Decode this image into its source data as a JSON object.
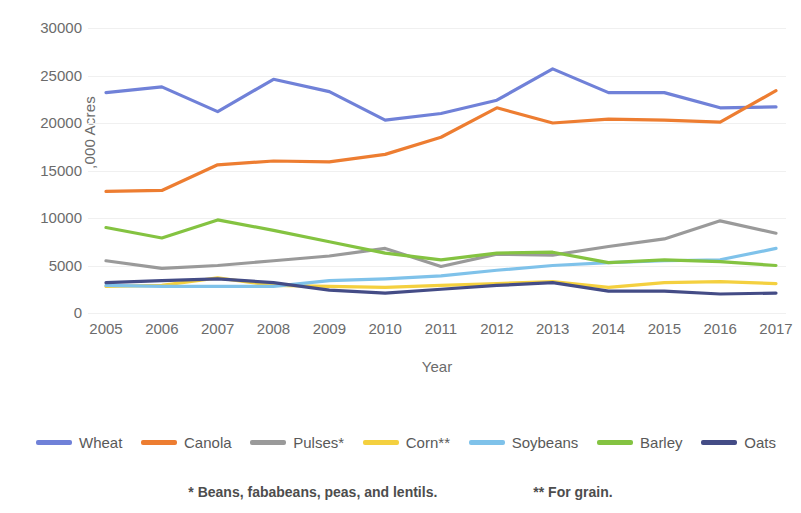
{
  "chart_data": {
    "type": "line",
    "title": "",
    "xlabel": "Year",
    "ylabel": ",000 Acres",
    "categories": [
      "2005",
      "2006",
      "2007",
      "2008",
      "2009",
      "2010",
      "2011",
      "2012",
      "2013",
      "2014",
      "2015",
      "2016",
      "2017"
    ],
    "x": [
      2005,
      2006,
      2007,
      2008,
      2009,
      2010,
      2011,
      2012,
      2013,
      2014,
      2015,
      2016,
      2017
    ],
    "ylim": [
      0,
      30000
    ],
    "yticks": [
      0,
      5000,
      10000,
      15000,
      20000,
      25000,
      30000
    ],
    "ytick_labels": [
      "0",
      "5000",
      "10000",
      "15000",
      "20000",
      "25000",
      "30000"
    ],
    "grid": true,
    "legend_position": "bottom",
    "series": [
      {
        "name": "Wheat",
        "color": "#7081D8",
        "values": [
          23200,
          23800,
          21200,
          24600,
          23300,
          20300,
          21000,
          22400,
          25700,
          23200,
          23200,
          21600,
          21700
        ]
      },
      {
        "name": "Canola",
        "color": "#ED7D31",
        "values": [
          12800,
          12900,
          15600,
          16000,
          15900,
          16700,
          18500,
          21600,
          20000,
          20400,
          20300,
          20100,
          23400
        ]
      },
      {
        "name": "Pulses*",
        "color": "#9A9A9A",
        "values": [
          5500,
          4700,
          5000,
          5500,
          6000,
          6800,
          4900,
          6200,
          6100,
          7000,
          7800,
          9700,
          8400
        ]
      },
      {
        "name": "Corn**",
        "color": "#F4D03F",
        "values": [
          2800,
          2900,
          3700,
          2900,
          2800,
          2700,
          2900,
          3100,
          3300,
          2700,
          3200,
          3300,
          3100
        ]
      },
      {
        "name": "Soybeans",
        "color": "#7FC2EA",
        "values": [
          2900,
          2800,
          2800,
          2800,
          3400,
          3600,
          3900,
          4500,
          5000,
          5300,
          5500,
          5600,
          6800
        ]
      },
      {
        "name": "Barley",
        "color": "#84C341",
        "values": [
          9000,
          7900,
          9800,
          8700,
          7500,
          6300,
          5600,
          6300,
          6400,
          5300,
          5600,
          5400,
          5000
        ]
      },
      {
        "name": "Oats",
        "color": "#444C86",
        "values": [
          3200,
          3400,
          3600,
          3200,
          2400,
          2100,
          2500,
          2900,
          3200,
          2300,
          2300,
          2000,
          2100
        ]
      }
    ],
    "annotations": [
      "* Beans, fababeans, peas, and lentils.",
      "** For grain."
    ]
  },
  "footnotes": {
    "left": "* Beans, fababeans, peas, and lentils.",
    "right": "** For grain."
  }
}
